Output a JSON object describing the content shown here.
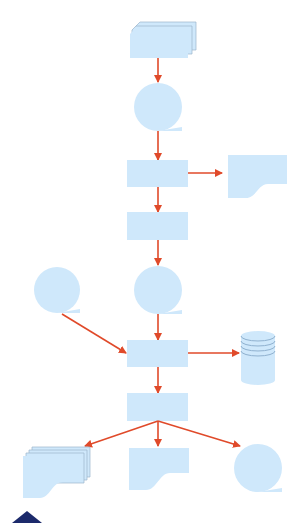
{
  "diagram": {
    "type": "flowchart",
    "colors": {
      "shape_fill": "#cfe8fb",
      "arrow": "#e04a2a",
      "corner_mark": "#1c2a6b",
      "background": "#ffffff"
    },
    "nodes": [
      {
        "id": "n1",
        "kind": "multi-document-card",
        "label": ""
      },
      {
        "id": "n2",
        "kind": "sequential-data",
        "label": ""
      },
      {
        "id": "n3",
        "kind": "process",
        "label": ""
      },
      {
        "id": "n4",
        "kind": "document",
        "label": ""
      },
      {
        "id": "n5",
        "kind": "process",
        "label": ""
      },
      {
        "id": "n6",
        "kind": "sequential-data",
        "label": ""
      },
      {
        "id": "n7",
        "kind": "sequential-data",
        "label": ""
      },
      {
        "id": "n8",
        "kind": "process",
        "label": ""
      },
      {
        "id": "n9",
        "kind": "database",
        "label": ""
      },
      {
        "id": "n10",
        "kind": "process",
        "label": ""
      },
      {
        "id": "n11",
        "kind": "multi-document",
        "label": ""
      },
      {
        "id": "n12",
        "kind": "document",
        "label": ""
      },
      {
        "id": "n13",
        "kind": "sequential-data",
        "label": ""
      }
    ],
    "edges": [
      {
        "from": "n1",
        "to": "n2"
      },
      {
        "from": "n2",
        "to": "n3"
      },
      {
        "from": "n3",
        "to": "n4"
      },
      {
        "from": "n3",
        "to": "n5"
      },
      {
        "from": "n5",
        "to": "n6"
      },
      {
        "from": "n6",
        "to": "n8"
      },
      {
        "from": "n7",
        "to": "n8"
      },
      {
        "from": "n8",
        "to": "n9"
      },
      {
        "from": "n8",
        "to": "n10"
      },
      {
        "from": "n10",
        "to": "n11"
      },
      {
        "from": "n10",
        "to": "n12"
      },
      {
        "from": "n10",
        "to": "n13"
      }
    ]
  }
}
